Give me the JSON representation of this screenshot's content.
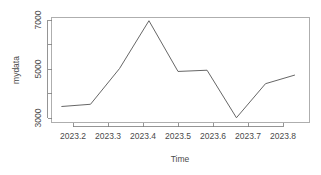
{
  "chart_data": {
    "type": "line",
    "title": "",
    "subtitle": "",
    "xlabel": "Time",
    "ylabel": "mydata",
    "xlim": [
      2023.155,
      2023.895
    ],
    "ylim": [
      2870,
      7150
    ],
    "grid": false,
    "legend": null,
    "x_ticks": [
      2023.2,
      2023.3,
      2023.4,
      2023.5,
      2023.6,
      2023.7,
      2023.8
    ],
    "x_tick_labels": [
      "2023.2",
      "2023.3",
      "2023.4",
      "2023.5",
      "2023.6",
      "2023.7",
      "2023.8"
    ],
    "y_ticks": [
      3000,
      4000,
      5000,
      6000,
      7000
    ],
    "y_tick_labels": [
      "3000",
      "",
      "5000",
      "",
      "7000"
    ],
    "y_labeled_ticks": [
      3000,
      5000,
      7000
    ],
    "series": [
      {
        "name": "mydata",
        "color": "#555555",
        "x": [
          2023.168,
          2023.25,
          2023.333,
          2023.417,
          2023.5,
          2023.583,
          2023.667,
          2023.75,
          2023.833
        ],
        "values": [
          3470,
          3560,
          5020,
          6970,
          4900,
          4950,
          3010,
          4400,
          4750
        ]
      }
    ]
  },
  "axes": {
    "y_axis_label": "mydata",
    "x_axis_label": "Time"
  },
  "colors": {
    "background": "#ffffff",
    "line": "#555555",
    "axis": "#7a7a7a",
    "box": "#9a9a9a",
    "text": "#4a4a4a"
  }
}
